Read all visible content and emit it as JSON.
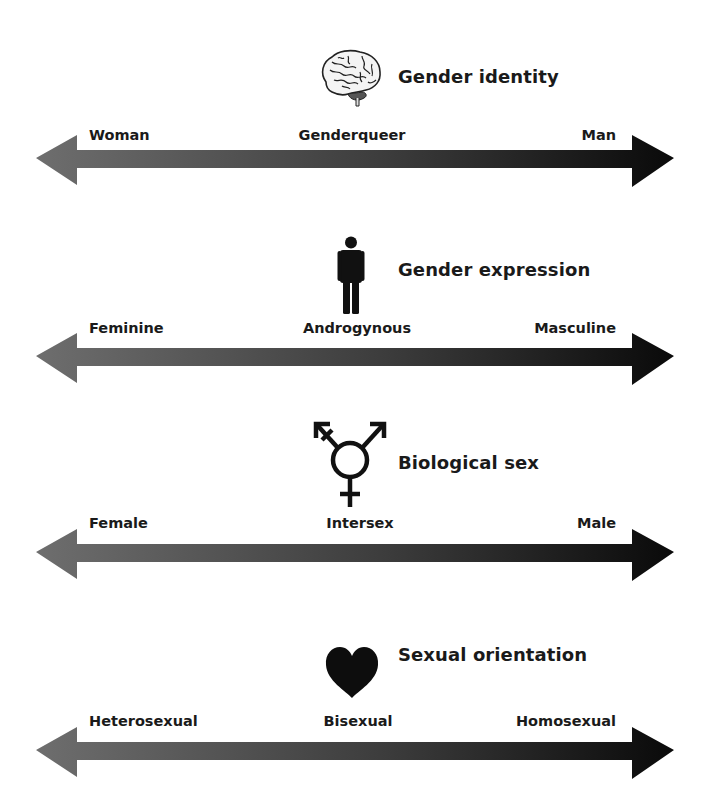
{
  "diagram": {
    "gradient": {
      "start_color": "#6e6e6e",
      "end_color": "#0c0c0c"
    },
    "scales": [
      {
        "title": "Gender identity",
        "icon": "brain-icon",
        "left_label": "Woman",
        "middle_label": "Genderqueer",
        "right_label": "Man"
      },
      {
        "title": "Gender expression",
        "icon": "person-icon",
        "left_label": "Feminine",
        "middle_label": "Androgynous",
        "right_label": "Masculine"
      },
      {
        "title": "Biological sex",
        "icon": "transgender-symbol-icon",
        "left_label": "Female",
        "middle_label": "Intersex",
        "right_label": "Male"
      },
      {
        "title": "Sexual orientation",
        "icon": "heart-icon",
        "left_label": "Heterosexual",
        "middle_label": "Bisexual",
        "right_label": "Homosexual"
      }
    ]
  }
}
